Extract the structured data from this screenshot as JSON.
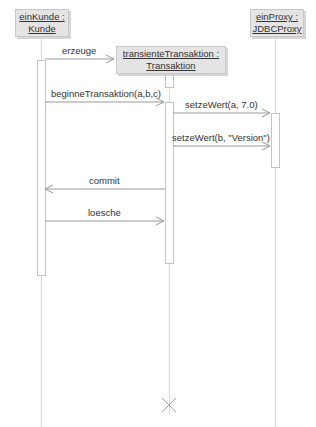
{
  "diagram": {
    "type": "uml-sequence",
    "objects": [
      {
        "id": "kunde",
        "name": "einKunde :",
        "class": "Kunde"
      },
      {
        "id": "transaktion",
        "name": "transienteTransaktion :",
        "class": "Transaktion"
      },
      {
        "id": "proxy",
        "name": "einProxy :",
        "class": "JDBCProxy"
      }
    ],
    "messages": [
      {
        "label": "erzeuge",
        "from": "kunde",
        "to": "transaktion",
        "kind": "create"
      },
      {
        "label": "beginneTransaktion(a,b,c)",
        "from": "kunde",
        "to": "transaktion",
        "kind": "call"
      },
      {
        "label": "setzeWert(a, 7.0)",
        "from": "transaktion",
        "to": "proxy",
        "kind": "call"
      },
      {
        "label": "setzeWert(b, \"Version\")",
        "from": "transaktion",
        "to": "proxy",
        "kind": "call"
      },
      {
        "label": "commit",
        "from": "transaktion",
        "to": "kunde",
        "kind": "return"
      },
      {
        "label": "loesche",
        "from": "kunde",
        "to": "transaktion",
        "kind": "call"
      }
    ],
    "destruction": {
      "object": "transaktion",
      "icon": "x-destroy-icon"
    }
  }
}
